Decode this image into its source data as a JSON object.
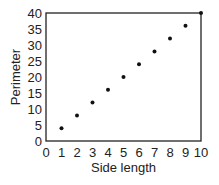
{
  "chart_data": {
    "type": "scatter",
    "title": "",
    "xlabel": "Side length",
    "ylabel": "Perimeter",
    "xlim": [
      0,
      10
    ],
    "ylim": [
      0,
      40
    ],
    "xticks": [
      "0",
      "1",
      "2",
      "3",
      "4",
      "5",
      "6",
      "7",
      "8",
      "9",
      "10"
    ],
    "yticks": [
      "0",
      "5",
      "10",
      "15",
      "20",
      "25",
      "30",
      "35",
      "40"
    ],
    "grid": false,
    "legend": null,
    "series": [
      {
        "name": "Perimeter",
        "x": [
          1,
          2,
          3,
          4,
          5,
          6,
          7,
          8,
          9,
          10
        ],
        "y": [
          4,
          8,
          12,
          16,
          20,
          24,
          28,
          32,
          36,
          40
        ]
      }
    ]
  }
}
